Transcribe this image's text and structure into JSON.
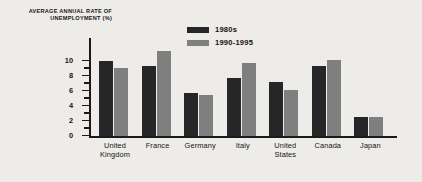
{
  "chart_data": {
    "type": "bar",
    "title": "",
    "ylabel": "AVERAGE ANNUAL RATE OF UNEMPLOYMENT (%)",
    "xlabel": "",
    "categories": [
      "United Kingdom",
      "France",
      "Germany",
      "Italy",
      "United States",
      "Canada",
      "Japan"
    ],
    "series": [
      {
        "name": "1980s",
        "color": "#262528",
        "values": [
          10.0,
          9.4,
          5.7,
          7.7,
          7.2,
          9.4,
          2.5
        ]
      },
      {
        "name": "1990-1995",
        "color": "#7f7f80",
        "values": [
          9.1,
          11.3,
          5.5,
          9.8,
          6.2,
          10.2,
          2.6
        ]
      }
    ],
    "ylim": [
      0,
      12
    ],
    "yticks": [
      {
        "value": 10,
        "label": "10"
      },
      {
        "value": 9,
        "label": ""
      },
      {
        "value": 8,
        "label": "8"
      },
      {
        "value": 7,
        "label": ""
      },
      {
        "value": 6,
        "label": "6"
      },
      {
        "value": 5,
        "label": ""
      },
      {
        "value": 4,
        "label": "4"
      },
      {
        "value": 3,
        "label": ""
      },
      {
        "value": 2,
        "label": "2"
      },
      {
        "value": 1,
        "label": ""
      },
      {
        "value": 0,
        "label": "0"
      }
    ],
    "grid": false,
    "legend_position": "top-right",
    "background_color": "#eeece8",
    "axis_color": "#1a191b"
  }
}
